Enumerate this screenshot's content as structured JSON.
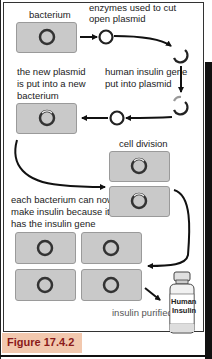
{
  "figure": {
    "caption": "Figure 17.4.2"
  },
  "labels": {
    "bacterium": "bacterium",
    "enzymes_line1": "enzymes used to cut",
    "enzymes_line2": "open plasmid",
    "gene_line1": "human insulin gene",
    "gene_line2": "put into plasmid",
    "new_plasmid_line1": "the new plasmid",
    "new_plasmid_line2": "is put into a new",
    "new_plasmid_line3": "bacterium",
    "cell_division": "cell division",
    "each_line1": "each bacterium can now",
    "each_line2": "make insulin because it",
    "each_line3": "has the insulin gene",
    "purified": "insulin purified"
  },
  "bottle": {
    "label_line1": "Human",
    "label_line2": "Insulin"
  },
  "steps": [
    "bacterium",
    "enzymes used to cut open plasmid",
    "human insulin gene put into plasmid",
    "the new plasmid is put into a new bacterium",
    "cell division",
    "each bacterium can now make insulin because it has the insulin gene",
    "insulin purified"
  ],
  "colors": {
    "cell_fill": "#c9c9c9",
    "caption_bg": "#f2c8ae",
    "caption_text": "#8a1a1a",
    "arrow": "#111111"
  }
}
